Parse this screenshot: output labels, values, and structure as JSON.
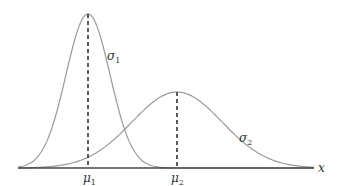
{
  "chart_data": {
    "type": "line",
    "title": "",
    "xlabel": "x",
    "ylabel": "",
    "grid": false,
    "legend": "none",
    "series": [
      {
        "name": "σ1",
        "mean_label": "μ1",
        "mean_px": 88,
        "peak_px_y": 14,
        "sigma_px": 22,
        "color": "#9a9a9a"
      },
      {
        "name": "σ2",
        "mean_label": "μ2",
        "mean_px": 177,
        "peak_px_y": 92,
        "sigma_px": 45,
        "color": "#9a9a9a"
      }
    ],
    "annotations": [
      "μ1",
      "μ2",
      "σ1",
      "σ2",
      "x"
    ],
    "note": "Two normal distributions: narrow tall one centered at μ1 with std σ1, wide short one centered at μ2 with std σ2 (σ2 > σ1). Dashed vertical lines mark the means."
  },
  "labels": {
    "mu1": "μ",
    "mu1_sub": "1",
    "mu2": "μ",
    "mu2_sub": "2",
    "sigma1": "σ",
    "sigma1_sub": "1",
    "sigma2": "σ",
    "sigma2_sub": "2",
    "x_axis": "x"
  }
}
